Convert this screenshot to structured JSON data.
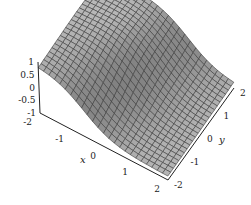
{
  "chart_data": {
    "type": "surface3d",
    "title": "",
    "xlabel": "x",
    "ylabel": "y",
    "zlabel": "",
    "xlim": [
      -2,
      2
    ],
    "ylim": [
      -2,
      2
    ],
    "zlim": [
      -1,
      1
    ],
    "x_ticks": [
      "-2",
      "-1",
      "0",
      "1",
      "2"
    ],
    "y_ticks": [
      "-2",
      "-1",
      "0",
      "1",
      "2"
    ],
    "z_ticks": [
      "1",
      "0.5",
      "0",
      "-0.5",
      "-1"
    ],
    "mesh_resolution": 24,
    "surface_description": "smooth sigmoidal surface: plateau near z=1 on the x<0 side, falling toward z=-1 for large x, with a ridge/depression pattern along y",
    "colors": {
      "surface": "#a8a8a8",
      "mesh": "#3a3a3a",
      "axes": "#222222"
    }
  }
}
